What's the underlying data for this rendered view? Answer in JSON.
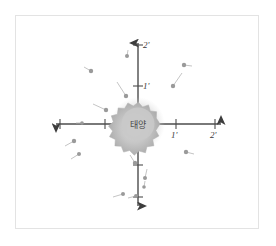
{
  "figure": {
    "title": "",
    "background_color": "#ffffff",
    "frame_color": "#e3e3e3"
  },
  "center_body": {
    "name": "sun",
    "label": "태양",
    "cx": 138,
    "cy": 124,
    "core_radius": 17,
    "spike_radius": 23,
    "color": "#b9b9b9",
    "core_color": "#cfcfcf"
  },
  "axes": {
    "origin": {
      "x": 138,
      "y": 124
    },
    "color": "#4d4d4d",
    "vertical": {
      "name": "vertical-axis",
      "top_y": 35,
      "bottom_y": 214,
      "arrow_both_ends": true,
      "ticks": [
        {
          "label": "2'",
          "y": 45,
          "label_x": 143,
          "label_y": 40
        },
        {
          "label": "1'",
          "y": 86,
          "label_x": 143,
          "label_y": 81
        },
        {
          "label": "",
          "y": 165
        },
        {
          "label": "",
          "y": 200
        }
      ]
    },
    "horizontal": {
      "name": "horizontal-axis",
      "left_x": 48,
      "right_x": 228,
      "arrow_both_ends": true,
      "ticks": [
        {
          "label": "",
          "x": 59
        },
        {
          "label": "",
          "x": 82
        },
        {
          "label": "",
          "x": 105
        },
        {
          "label": "1'",
          "x": 176,
          "label_x": 171,
          "label_y": 130
        },
        {
          "label": "2'",
          "x": 215,
          "label_x": 210,
          "label_y": 130
        }
      ]
    }
  },
  "chart_data": {
    "type": "scatter",
    "title": "",
    "xlabel": "",
    "ylabel": "",
    "axis_tick_labels_x": [
      "1'",
      "2'"
    ],
    "axis_tick_labels_y": [
      "1'",
      "2'"
    ],
    "dot_color": "#9a9a9a",
    "tail_color": "#b5b5b5",
    "objects": [
      {
        "id": "o1",
        "quadrant": "Q2",
        "x": 127,
        "y": 56,
        "r": 2.0,
        "tail_dx": 1,
        "tail_dy": -6
      },
      {
        "id": "o2",
        "quadrant": "Q2",
        "x": 91,
        "y": 71,
        "r": 2.2,
        "tail_dx": -7,
        "tail_dy": -4
      },
      {
        "id": "o3",
        "quadrant": "Q2",
        "x": 126,
        "y": 96,
        "r": 2.2,
        "tail_dx": -9,
        "tail_dy": -14
      },
      {
        "id": "o4",
        "quadrant": "Q2",
        "x": 106,
        "y": 110,
        "r": 2.2,
        "tail_dx": -13,
        "tail_dy": -6
      },
      {
        "id": "o5",
        "quadrant": "Q1",
        "x": 184,
        "y": 65,
        "r": 2.2,
        "tail_dx": 8,
        "tail_dy": 1
      },
      {
        "id": "o6",
        "quadrant": "Q1",
        "x": 173,
        "y": 86,
        "r": 2.2,
        "tail_dx": 9,
        "tail_dy": -13
      },
      {
        "id": "o7",
        "quadrant": "Q3",
        "x": 74,
        "y": 141,
        "r": 2.2,
        "tail_dx": -9,
        "tail_dy": 5
      },
      {
        "id": "o8",
        "quadrant": "Q3",
        "x": 79,
        "y": 154,
        "r": 2.0,
        "tail_dx": -8,
        "tail_dy": 5
      },
      {
        "id": "o9",
        "quadrant": "Q3",
        "x": 123,
        "y": 194,
        "r": 2.0,
        "tail_dx": -10,
        "tail_dy": 3
      },
      {
        "id": "o10",
        "quadrant": "Q3",
        "x": 136,
        "y": 196,
        "r": 2.0,
        "tail_dx": -8,
        "tail_dy": 2
      },
      {
        "id": "o11",
        "quadrant": "Q4",
        "x": 135,
        "y": 163,
        "r": 2.2,
        "tail_dx": -5,
        "tail_dy": -8
      },
      {
        "id": "o12",
        "quadrant": "Q4",
        "x": 145,
        "y": 178,
        "r": 2.0,
        "tail_dx": 2,
        "tail_dy": -9
      },
      {
        "id": "o13",
        "quadrant": "Q4",
        "x": 144,
        "y": 187,
        "r": 1.8,
        "tail_dx": 1,
        "tail_dy": -6
      },
      {
        "id": "o14",
        "quadrant": "Q4",
        "x": 186,
        "y": 152,
        "r": 2.2,
        "tail_dx": 8,
        "tail_dy": 2
      },
      {
        "id": "o15",
        "quadrant": "axis-left",
        "x": 82,
        "y": 123,
        "r": 1.8,
        "tail_dx": -6,
        "tail_dy": 0
      }
    ]
  }
}
